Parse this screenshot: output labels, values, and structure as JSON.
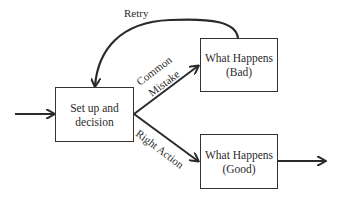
{
  "diagram": {
    "nodes": {
      "setup": {
        "line1": "Set up and",
        "line2": "decision"
      },
      "bad": {
        "line1": "What Happens",
        "line2": "(Bad)"
      },
      "good": {
        "line1": "What Happens",
        "line2": "(Good)"
      }
    },
    "edges": {
      "retry": "Retry",
      "common_mistake_1": "Common",
      "common_mistake_2": "Mistake",
      "right_action": "Right Action"
    },
    "colors": {
      "stroke": "#2a2a2a",
      "background": "#ffffff"
    }
  }
}
